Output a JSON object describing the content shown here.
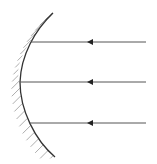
{
  "diagram": {
    "colors": {
      "background": "#ffffff",
      "mirror": "#333333",
      "hatch": "#8a8a8a",
      "ray": "#555555"
    },
    "mirror": {
      "type": "convex",
      "hatched_side": "left",
      "top": [
        53,
        13
      ],
      "vertex": [
        20,
        82
      ],
      "bottom": [
        55,
        157
      ]
    },
    "rays": [
      {
        "label": "ray-top",
        "y": 42,
        "x_start": 146,
        "arrow_x": 90,
        "direction": "left"
      },
      {
        "label": "ray-middle",
        "y": 82,
        "x_start": 146,
        "arrow_x": 90,
        "direction": "left"
      },
      {
        "label": "ray-bottom",
        "y": 123,
        "x_start": 146,
        "arrow_x": 90,
        "direction": "left"
      }
    ]
  }
}
